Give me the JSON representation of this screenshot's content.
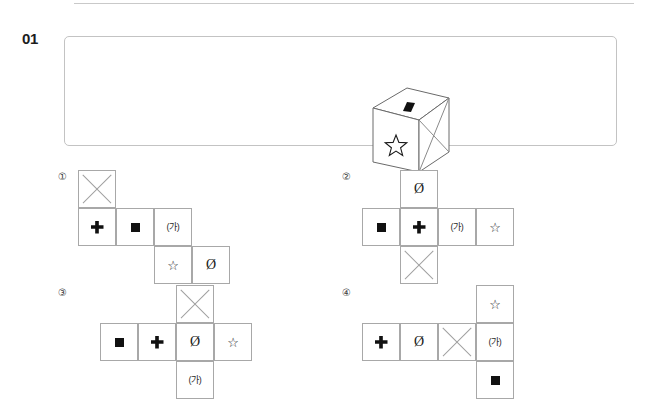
{
  "page": {
    "question_number": "01",
    "divider": "top-rule"
  },
  "stem": {
    "figure": "cube",
    "faces": {
      "front": "star",
      "top": "black-parallelogram",
      "right": "x-cross"
    }
  },
  "glyphs": {
    "star": "☆",
    "empty_set": "Ø",
    "ka": "(가)",
    "black_square": "■",
    "plus": "✚",
    "x_cross": "✕"
  },
  "options": [
    {
      "label": "①",
      "name": "option-1",
      "cells": [
        {
          "name": "cell-x",
          "glyph": "x_cross",
          "text": "",
          "col": 0,
          "row": 0
        },
        {
          "name": "cell-plus",
          "glyph": "plus",
          "text": "",
          "col": 0,
          "row": 1
        },
        {
          "name": "cell-square",
          "glyph": "black_square",
          "text": "",
          "col": 1,
          "row": 1
        },
        {
          "name": "cell-ka",
          "glyph": "ka",
          "text": "(가)",
          "col": 2,
          "row": 1
        },
        {
          "name": "cell-star",
          "glyph": "star",
          "text": "☆",
          "col": 2,
          "row": 2
        },
        {
          "name": "cell-empty",
          "glyph": "empty_set",
          "text": "Ø",
          "col": 3,
          "row": 2
        }
      ]
    },
    {
      "label": "②",
      "name": "option-2",
      "cells": [
        {
          "name": "cell-empty",
          "glyph": "empty_set",
          "text": "Ø",
          "col": 1,
          "row": 0
        },
        {
          "name": "cell-square",
          "glyph": "black_square",
          "text": "",
          "col": 0,
          "row": 1
        },
        {
          "name": "cell-plus",
          "glyph": "plus",
          "text": "",
          "col": 1,
          "row": 1
        },
        {
          "name": "cell-ka",
          "glyph": "ka",
          "text": "(가)",
          "col": 2,
          "row": 1
        },
        {
          "name": "cell-star",
          "glyph": "star",
          "text": "☆",
          "col": 3,
          "row": 1
        },
        {
          "name": "cell-x",
          "glyph": "x_cross",
          "text": "",
          "col": 1,
          "row": 2
        }
      ]
    },
    {
      "label": "③",
      "name": "option-3",
      "cells": [
        {
          "name": "cell-x",
          "glyph": "x_cross",
          "text": "",
          "col": 2,
          "row": 0
        },
        {
          "name": "cell-square",
          "glyph": "black_square",
          "text": "",
          "col": 0,
          "row": 1
        },
        {
          "name": "cell-plus",
          "glyph": "plus",
          "text": "",
          "col": 1,
          "row": 1
        },
        {
          "name": "cell-empty",
          "glyph": "empty_set",
          "text": "Ø",
          "col": 2,
          "row": 1
        },
        {
          "name": "cell-star",
          "glyph": "star",
          "text": "☆",
          "col": 3,
          "row": 1
        },
        {
          "name": "cell-ka",
          "glyph": "ka",
          "text": "(가)",
          "col": 2,
          "row": 2
        }
      ]
    },
    {
      "label": "④",
      "name": "option-4",
      "cells": [
        {
          "name": "cell-star",
          "glyph": "star",
          "text": "☆",
          "col": 3,
          "row": 0
        },
        {
          "name": "cell-plus",
          "glyph": "plus",
          "text": "",
          "col": 0,
          "row": 1
        },
        {
          "name": "cell-empty",
          "glyph": "empty_set",
          "text": "Ø",
          "col": 1,
          "row": 1
        },
        {
          "name": "cell-x",
          "glyph": "x_cross",
          "text": "",
          "col": 2,
          "row": 1
        },
        {
          "name": "cell-ka",
          "glyph": "ka",
          "text": "(가)",
          "col": 3,
          "row": 1
        },
        {
          "name": "cell-square",
          "glyph": "black_square",
          "text": "",
          "col": 3,
          "row": 2
        }
      ]
    }
  ],
  "colors": {
    "cell_border": "#a8a8a8",
    "box_border": "#c3c3c3",
    "rule": "#c9c9c9",
    "ink": "#1a1a1a",
    "fill_black": "#111111"
  },
  "layout": {
    "cell_size": 38,
    "option_origins": [
      {
        "label_x": 58,
        "label_y": 172,
        "grid_x": 78,
        "grid_y": 170
      },
      {
        "label_x": 342,
        "label_y": 172,
        "grid_x": 362,
        "grid_y": 170
      },
      {
        "label_x": 58,
        "label_y": 288,
        "grid_x": 100,
        "grid_y": 285
      },
      {
        "label_x": 342,
        "label_y": 288,
        "grid_x": 362,
        "grid_y": 285
      }
    ]
  }
}
